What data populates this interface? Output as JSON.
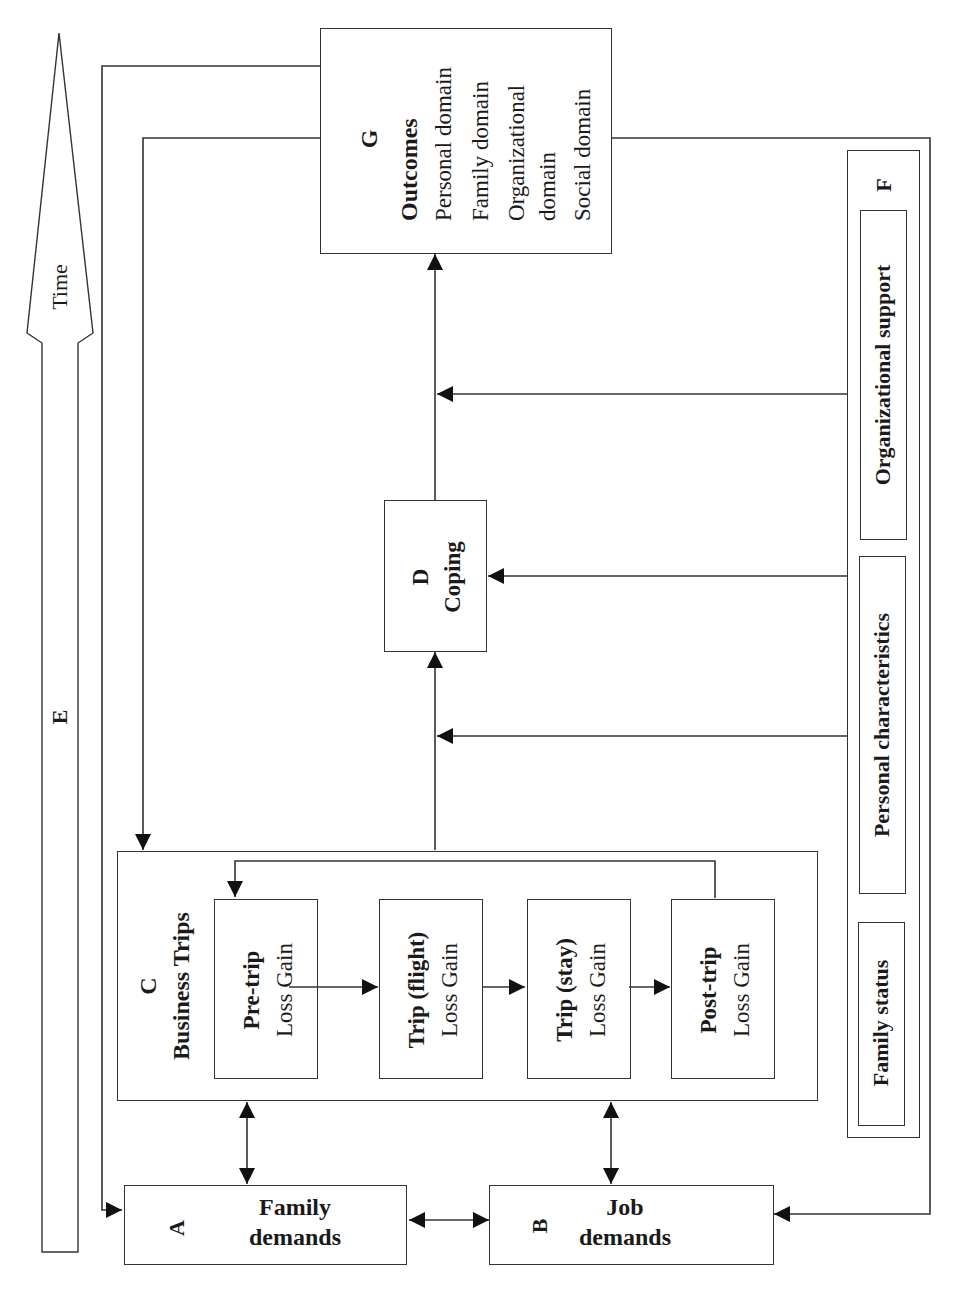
{
  "time_arrow": {
    "label": "Time",
    "letter": "E"
  },
  "family_demands": {
    "letter": "A",
    "line1": "Family",
    "line2": "demands"
  },
  "job_demands": {
    "letter": "B",
    "line1": "Job",
    "line2": "demands"
  },
  "business_trips": {
    "letter": "C",
    "title": "Business Trips",
    "stages": [
      {
        "name": "Pre-trip",
        "detail": "Loss Gain"
      },
      {
        "name": "Trip (flight)",
        "detail": "Loss Gain"
      },
      {
        "name": "Trip (stay)",
        "detail": "Loss Gain"
      },
      {
        "name": "Post-trip",
        "detail": "Loss Gain"
      }
    ]
  },
  "coping": {
    "letter": "D",
    "title": "Coping"
  },
  "moderators": {
    "letter": "F",
    "items": [
      "Organizational support",
      "Personal characteristics",
      "Family status"
    ]
  },
  "outcomes": {
    "letter": "G",
    "title": "Outcomes",
    "items": [
      "Personal domain",
      "Family domain",
      "Organizational",
      "domain",
      "Social domain"
    ]
  },
  "colors": {
    "line": "#333333",
    "arrowhead": "#111111",
    "background": "#ffffff"
  }
}
